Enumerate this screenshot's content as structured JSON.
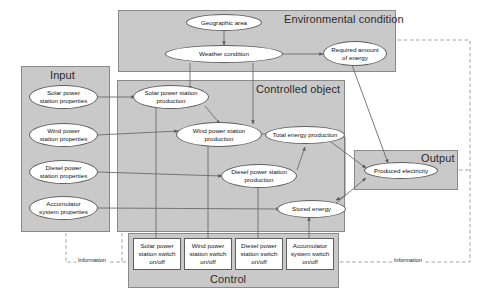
{
  "diagram": {
    "colors": {
      "group_fill": "#c9c9c9",
      "group_border": "#8a8a8a",
      "node_fill": "#ffffff",
      "node_border": "#5f5f5f",
      "line": "#6b6b6b",
      "dashed_line": "#9a9a9a"
    }
  },
  "groups": {
    "environmental_condition": {
      "label": "Environmental condition"
    },
    "input": {
      "label": "Input"
    },
    "controlled_object": {
      "label": "Controlled object"
    },
    "output": {
      "label": "Output"
    },
    "control": {
      "label": "Control"
    }
  },
  "nodes": {
    "geographic_area": {
      "label": "Geographic area"
    },
    "weather_condition": {
      "label": "Weather condition"
    },
    "required_amount_of_energy": {
      "line1": "Required amount",
      "line2": "of energy"
    },
    "solar_power_station_properties": {
      "line1": "Solar power",
      "line2": "station properties"
    },
    "wind_power_station_properties": {
      "line1": "Wind power",
      "line2": "station properties"
    },
    "diesel_power_station_properties": {
      "line1": "Diesel power",
      "line2": "station properties"
    },
    "accumulator_system_properties": {
      "line1": "Accumulator",
      "line2": "system properties"
    },
    "solar_power_station_production": {
      "line1": "Solar power station",
      "line2": "production"
    },
    "wind_power_station_production": {
      "line1": "Wind power station",
      "line2": "production"
    },
    "diesel_power_station_production": {
      "line1": "Diesel power station",
      "line2": "production"
    },
    "total_energy_production": {
      "label": "Total energy production"
    },
    "stored_energy": {
      "label": "Stored energy"
    },
    "produced_electricity": {
      "label": "Produced electricity"
    }
  },
  "switches": {
    "solar": {
      "line1": "Solar power",
      "line2": "station switch",
      "line3": "on/off"
    },
    "wind": {
      "line1": "Wind power",
      "line2": "station switch",
      "line3": "on/off"
    },
    "diesel": {
      "line1": "Diesel power",
      "line2": "station switch",
      "line3": "on/off"
    },
    "accumulator": {
      "line1": "Accumulator",
      "line2": "system switch",
      "line3": "on/off"
    }
  },
  "labels": {
    "information_left": "Information",
    "information_right": "Information"
  }
}
